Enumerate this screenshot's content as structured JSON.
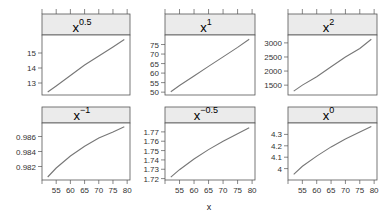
{
  "chart_data": {
    "type": "line",
    "layout": "lattice 3x2 panels",
    "xlabel": "x",
    "ylabel": "",
    "xlim": [
      50,
      81
    ],
    "x_ticks": [
      55,
      60,
      65,
      70,
      75,
      80
    ],
    "x": [
      52,
      55,
      60,
      65,
      70,
      75,
      79
    ],
    "panels": [
      {
        "name": "x^0.5",
        "base": "x",
        "exp": "0.5",
        "row": 0,
        "col": 0,
        "ylim": [
          12.2,
          16.2
        ],
        "y_ticks": [
          13,
          14,
          15
        ],
        "values": [
          12.4,
          12.8,
          13.5,
          14.2,
          14.8,
          15.4,
          15.9
        ]
      },
      {
        "name": "x^1",
        "base": "x",
        "exp": "1",
        "row": 0,
        "col": 1,
        "ylim": [
          48.5,
          80
        ],
        "y_ticks": [
          50,
          55,
          60,
          65,
          70,
          75
        ],
        "values": [
          50.2,
          53.5,
          58.5,
          63.5,
          68.5,
          73.5,
          77.8
        ]
      },
      {
        "name": "x^2",
        "base": "x",
        "exp": "2",
        "row": 0,
        "col": 2,
        "ylim": [
          1150,
          3280
        ],
        "y_ticks": [
          1500,
          2000,
          2500,
          3000
        ],
        "values": [
          1290,
          1500,
          1800,
          2150,
          2500,
          2800,
          3130
        ]
      },
      {
        "name": "x^-1",
        "base": "x",
        "exp": "−1",
        "row": 1,
        "col": 0,
        "ylim": [
          0.9802,
          0.9878
        ],
        "y_ticks": [
          0.982,
          0.984,
          0.986
        ],
        "values": [
          0.9806,
          0.9818,
          0.9834,
          0.9847,
          0.9858,
          0.9866,
          0.9873
        ]
      },
      {
        "name": "x^-0.5",
        "base": "x",
        "exp": "−0.5",
        "row": 1,
        "col": 1,
        "ylim": [
          1.7185,
          1.7795
        ],
        "y_ticks": [
          1.72,
          1.73,
          1.74,
          1.75,
          1.76,
          1.77
        ],
        "values": [
          1.7215,
          1.7295,
          1.741,
          1.751,
          1.76,
          1.768,
          1.7745
        ]
      },
      {
        "name": "x^0",
        "base": "x",
        "exp": "0",
        "row": 1,
        "col": 2,
        "ylim": [
          3.9,
          4.4
        ],
        "y_ticks": [
          4.0,
          4.1,
          4.2,
          4.3
        ],
        "values": [
          3.95,
          4.02,
          4.11,
          4.19,
          4.26,
          4.32,
          4.37
        ]
      }
    ],
    "grid": false,
    "legend": "none",
    "line_color": "#777777",
    "strip_color": "#ebebeb"
  },
  "labels": {
    "x_axis": "x"
  }
}
